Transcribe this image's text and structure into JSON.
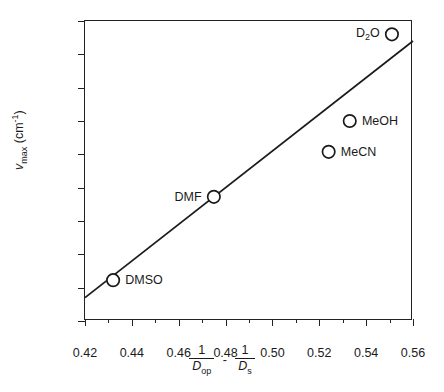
{
  "chart_data": {
    "type": "scatter",
    "title": "",
    "xlabel": "1/D_op - 1/D_s",
    "ylabel": "v_max (cm^-1)",
    "xlim": [
      0.42,
      0.56
    ],
    "ylim": [
      7800,
      9600
    ],
    "grid": false,
    "legend": "none",
    "x_ticks": [
      "0.42",
      "0.44",
      "0.46",
      "0.48",
      "0.50",
      "0.52",
      "0.54",
      "0.56"
    ],
    "x_tick_values": [
      0.42,
      0.44,
      0.46,
      0.48,
      0.5,
      0.52,
      0.54,
      0.56
    ],
    "x_minor_tick_values": [
      0.43,
      0.45,
      0.47,
      0.49,
      0.51,
      0.53,
      0.55
    ],
    "y_ticks": [
      "7800",
      "8000",
      "8200",
      "8400",
      "8600",
      "8800",
      "9000",
      "9200",
      "9400",
      "9600"
    ],
    "y_tick_values": [
      7800,
      8000,
      8200,
      8400,
      8600,
      8800,
      9000,
      9200,
      9400,
      9600
    ],
    "points": [
      {
        "label": "DMSO",
        "x": 0.432,
        "y": 8045,
        "label_side": "right"
      },
      {
        "label": "DMF",
        "x": 0.475,
        "y": 8545,
        "label_side": "left"
      },
      {
        "label": "MeCN",
        "x": 0.524,
        "y": 8815,
        "label_side": "right"
      },
      {
        "label": "MeOH",
        "x": 0.533,
        "y": 9000,
        "label_side": "right"
      },
      {
        "label": "D2O",
        "x": 0.551,
        "y": 9520,
        "label_side": "left"
      }
    ],
    "fit_line": {
      "x_start": 0.42,
      "y_start": 7940,
      "x_end": 0.56,
      "y_end": 9480
    },
    "marker_style": "open-circle",
    "marker_color": "#1a1a1a",
    "line_color": "#1a1a1a"
  },
  "axis_titles": {
    "y_symbol": "v",
    "y_subscript": "max",
    "y_unit_open": " (cm",
    "y_unit_exp": "-1",
    "y_unit_close": ")",
    "x_numerator": "1",
    "x_denom_1": "D",
    "x_denom_1_sub": "op",
    "x_operator": "-",
    "x_denom_2": "D",
    "x_denom_2_sub": "s"
  },
  "point_labels": {
    "dmso": "DMSO",
    "dmf": "DMF",
    "mecn": "MeCN",
    "meoh": "MeOH",
    "d2o_pre": "D",
    "d2o_sub": "2",
    "d2o_post": "O"
  }
}
